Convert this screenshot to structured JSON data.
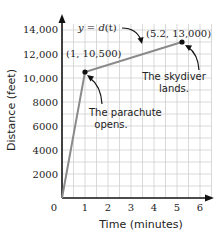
{
  "chart_data": {
    "type": "line",
    "title": "",
    "xlabel": "Time (minutes)",
    "ylabel": "Distance (feet)",
    "xlim": [
      0,
      6
    ],
    "ylim": [
      0,
      14000
    ],
    "x_ticks": [
      "0",
      "1",
      "2",
      "3",
      "4",
      "5",
      "6"
    ],
    "y_ticks": [
      "2000",
      "4000",
      "6000",
      "8000",
      "10,000",
      "12,000",
      "14,000"
    ],
    "grid": true,
    "grid_step": {
      "x": 0.5,
      "y": 1000
    },
    "series": [
      {
        "name": "y = d(t)",
        "points": [
          {
            "x": 0,
            "y": 0
          },
          {
            "x": 1,
            "y": 10500
          },
          {
            "x": 5.2,
            "y": 13000
          }
        ]
      }
    ],
    "annotations": [
      {
        "text": "y = d(t)",
        "target": "line segment"
      },
      {
        "text": "(1, 10,500)",
        "target": {
          "x": 1,
          "y": 10500
        }
      },
      {
        "text": "(5.2, 13,000)",
        "target": {
          "x": 5.2,
          "y": 13000
        }
      },
      {
        "text": "The parachute opens.",
        "target": {
          "x": 1,
          "y": 10500
        }
      },
      {
        "text": "The skydiver lands.",
        "target": {
          "x": 5.2,
          "y": 13000
        }
      }
    ]
  },
  "labels": {
    "origin": "0",
    "x_ticks": [
      "1",
      "2",
      "3",
      "4",
      "5",
      "6"
    ],
    "y_ticks": [
      "2000",
      "4000",
      "6000",
      "8000",
      "10,000",
      "12,000",
      "14,000"
    ],
    "xlabel": "Time (minutes)",
    "ylabel": "Distance (feet)",
    "func_label_y": "y",
    "func_label_eq": " = ",
    "func_label_d": "d",
    "func_label_t": "(t)",
    "point1_label": "(1, 10,500)",
    "point2_label": "(5.2, 13,000)",
    "note1_line1": "The parachute",
    "note1_line2": "opens.",
    "note2_line1": "The skydiver",
    "note2_line2": "lands."
  },
  "colors": {
    "grid": "#cfcfcf",
    "axis": "#111111",
    "line": "#8a8a8a",
    "point": "#111111"
  }
}
